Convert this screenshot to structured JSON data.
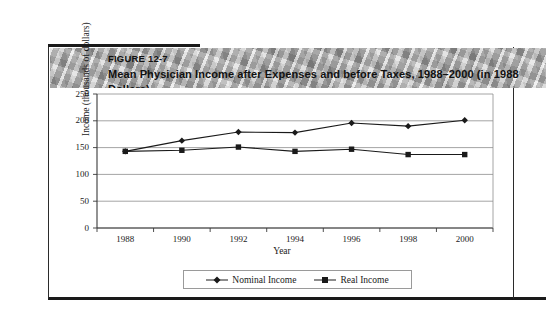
{
  "figure": {
    "number_label": "FIGURE 12-7",
    "title": "Mean Physician Income after Expenses and before Taxes, 1988–2000 (in 1988 Dollars)"
  },
  "legend": {
    "position": "bottom-center",
    "items": [
      {
        "label": "Nominal Income",
        "marker": "diamond-marker",
        "color": "#1a1a1a"
      },
      {
        "label": "Real Income",
        "marker": "square-marker",
        "color": "#1a1a1a"
      }
    ]
  },
  "chart_data": {
    "type": "line",
    "title": "Mean Physician Income after Expenses and before Taxes, 1988–2000 (in 1988 Dollars)",
    "xlabel": "Year",
    "ylabel": "Income (thousands of dollars)",
    "categories": [
      1988,
      1990,
      1992,
      1994,
      1996,
      1998,
      2000
    ],
    "xtick_labels": [
      "1988",
      "1990",
      "1992",
      "1994",
      "1996",
      "1998",
      "2000"
    ],
    "ytick_labels": [
      "0",
      "50",
      "100",
      "150",
      "200",
      "250"
    ],
    "yticks": [
      0,
      50,
      100,
      150,
      200,
      250
    ],
    "ylim": [
      0,
      250
    ],
    "grid": "horizontal",
    "series": [
      {
        "name": "Nominal Income",
        "marker": "diamond",
        "color": "#1a1a1a",
        "values": [
          143,
          163,
          179,
          178,
          196,
          190,
          201
        ]
      },
      {
        "name": "Real Income",
        "marker": "square",
        "color": "#1a1a1a",
        "values": [
          143,
          145,
          151,
          143,
          147,
          137,
          137
        ]
      }
    ]
  }
}
